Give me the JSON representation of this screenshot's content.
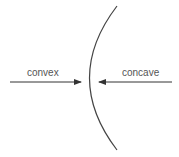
{
  "diagram": {
    "labels": {
      "left": "convex",
      "right": "concave"
    },
    "colors": {
      "line": "#444444",
      "text": "#555555",
      "background": "#ffffff"
    }
  }
}
